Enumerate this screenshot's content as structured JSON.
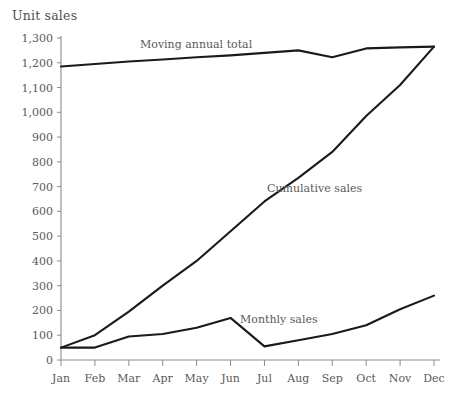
{
  "chart_data": {
    "type": "line",
    "title": "",
    "ylabel": "Unit sales",
    "xlabel": "",
    "categories": [
      "Jan",
      "Feb",
      "Mar",
      "Apr",
      "May",
      "Jun",
      "Jul",
      "Aug",
      "Sep",
      "Oct",
      "Nov",
      "Dec"
    ],
    "ylim": [
      0,
      1300
    ],
    "ytick_values": [
      0,
      100,
      200,
      300,
      400,
      500,
      600,
      700,
      800,
      900,
      1000,
      1100,
      1200,
      1300
    ],
    "ytick_labels": [
      "0",
      "100",
      "200",
      "300",
      "400",
      "500",
      "600",
      "700",
      "800",
      "900",
      "1,000",
      "1,100",
      "1,200",
      "1,300"
    ],
    "grid": false,
    "legend": "inline-annotations",
    "series": [
      {
        "name": "Moving annual total",
        "values": [
          1185,
          1195,
          1205,
          1213,
          1222,
          1230,
          1240,
          1250,
          1222,
          1258,
          1262,
          1265
        ]
      },
      {
        "name": "Cumulative sales",
        "values": [
          50,
          100,
          195,
          300,
          400,
          520,
          640,
          735,
          840,
          985,
          1110,
          1265
        ]
      },
      {
        "name": "Monthly sales",
        "values": [
          50,
          50,
          95,
          105,
          130,
          170,
          55,
          80,
          105,
          140,
          205,
          260
        ]
      }
    ],
    "annotations": [
      {
        "text": "Moving annual total",
        "series": "Moving annual total"
      },
      {
        "text": "Cumulative sales",
        "series": "Cumulative sales"
      },
      {
        "text": "Monthly sales",
        "series": "Monthly sales"
      }
    ],
    "axis_color": "#8c8c8c",
    "line_color": "#1a1a1a",
    "text_color": "#5a5a5a"
  }
}
